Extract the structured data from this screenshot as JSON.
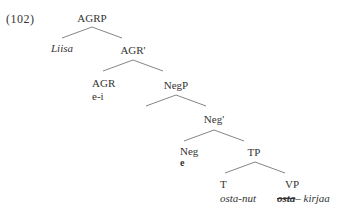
{
  "example": {
    "number": "(102)"
  },
  "tree": {
    "nodes": {
      "agrp": {
        "label": "AGRP"
      },
      "liisa": {
        "label": "Liisa"
      },
      "agr_bar": {
        "label": "AGR'"
      },
      "agr": {
        "label": "AGR",
        "word": "e-i"
      },
      "negp": {
        "label": "NegP"
      },
      "neg_bar": {
        "label": "Neg'"
      },
      "neg": {
        "label": "Neg",
        "word": "e"
      },
      "tp": {
        "label": "TP"
      },
      "t": {
        "label": "T",
        "word": "osta-nut"
      },
      "vp": {
        "label": "VP",
        "word_struck": "osta",
        "dash": "–",
        "word": "kirjaa"
      }
    },
    "edges": [
      [
        "AGRP",
        "Liisa"
      ],
      [
        "AGRP",
        "AGR'"
      ],
      [
        "AGR'",
        "AGR"
      ],
      [
        "AGR'",
        "NegP"
      ],
      [
        "NegP",
        "NegP-left"
      ],
      [
        "NegP",
        "Neg'"
      ],
      [
        "Neg'",
        "Neg"
      ],
      [
        "Neg'",
        "TP"
      ],
      [
        "TP",
        "T"
      ],
      [
        "TP",
        "VP"
      ]
    ],
    "colors": {
      "text": "#333333",
      "edge": "#777777",
      "background": "#ffffff"
    }
  }
}
